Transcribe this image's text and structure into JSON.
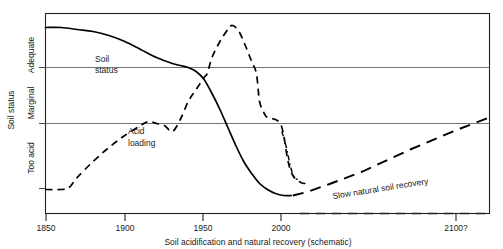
{
  "chart_data": {
    "type": "line",
    "title": "",
    "xlabel": "Soil acidification and natural recovery (schematic)",
    "ylabel": "Soil status",
    "grid": true,
    "legend_position": "inline-annotations",
    "xlim": [
      1850,
      2130
    ],
    "ylim": [
      0,
      100
    ],
    "xticks": [
      1850,
      1900,
      1950,
      2000,
      2100
    ],
    "xtick_labels": [
      "1850",
      "1900",
      "1950",
      "2000",
      "2100?"
    ],
    "ytick_categories": [
      "Too acid",
      "Marginal",
      "Adequate"
    ],
    "ygridlines": [
      40,
      70
    ],
    "annotations": [
      {
        "id": "soil-status",
        "text": "Soil status",
        "line1": "Soil",
        "line2": "status",
        "x": 1880,
        "y": 80
      },
      {
        "id": "acid-loading",
        "text": "Acid loading",
        "line1": "Acid",
        "line2": "loading",
        "x": 1905,
        "y": 35
      },
      {
        "id": "slow-recovery",
        "text": "Slow natural soil recovery",
        "x": 2030,
        "y": 14,
        "rotation": -8
      }
    ],
    "series": [
      {
        "name": "Soil status",
        "style": "solid",
        "color": "#000000",
        "points": [
          [
            1850,
            93
          ],
          [
            1860,
            93
          ],
          [
            1870,
            92
          ],
          [
            1880,
            91
          ],
          [
            1890,
            89
          ],
          [
            1900,
            86
          ],
          [
            1910,
            82
          ],
          [
            1920,
            78
          ],
          [
            1930,
            75
          ],
          [
            1935,
            74
          ],
          [
            1940,
            73
          ],
          [
            1945,
            71
          ],
          [
            1950,
            67
          ],
          [
            1955,
            60
          ],
          [
            1960,
            52
          ],
          [
            1965,
            43
          ],
          [
            1970,
            34
          ],
          [
            1975,
            26
          ],
          [
            1980,
            20
          ],
          [
            1985,
            15
          ],
          [
            1990,
            12
          ],
          [
            1995,
            10
          ],
          [
            2000,
            9
          ],
          [
            2005,
            9
          ]
        ]
      },
      {
        "name": "Acid loading",
        "style": "dashed",
        "color": "#000000",
        "points": [
          [
            1850,
            12
          ],
          [
            1860,
            12
          ],
          [
            1865,
            13
          ],
          [
            1870,
            18
          ],
          [
            1880,
            26
          ],
          [
            1890,
            33
          ],
          [
            1900,
            39
          ],
          [
            1910,
            44
          ],
          [
            1915,
            46
          ],
          [
            1920,
            45
          ],
          [
            1925,
            44
          ],
          [
            1930,
            41
          ],
          [
            1935,
            47
          ],
          [
            1940,
            56
          ],
          [
            1945,
            62
          ],
          [
            1950,
            68
          ],
          [
            1952,
            70
          ],
          [
            1955,
            78
          ],
          [
            1960,
            86
          ],
          [
            1965,
            92
          ],
          [
            1968,
            94
          ],
          [
            1972,
            91
          ],
          [
            1976,
            84
          ],
          [
            1980,
            76
          ],
          [
            1983,
            70
          ],
          [
            1985,
            56
          ],
          [
            1988,
            50
          ],
          [
            1990,
            48
          ],
          [
            1995,
            47
          ],
          [
            1998,
            45
          ],
          [
            2000,
            40
          ],
          [
            2003,
            26
          ],
          [
            2006,
            19
          ],
          [
            2010,
            16
          ],
          [
            2013,
            15
          ],
          [
            2016,
            16
          ]
        ]
      },
      {
        "name": "Alternative acid loading decline",
        "style": "dash-dot",
        "color": "#000000",
        "points": [
          [
            1999,
            41
          ],
          [
            2001,
            36
          ],
          [
            2003,
            29
          ],
          [
            2005,
            22
          ],
          [
            2007,
            18
          ],
          [
            2009,
            17
          ]
        ]
      },
      {
        "name": "Slow natural soil recovery",
        "style": "long-dashed",
        "color": "#000000",
        "points": [
          [
            2006,
            9
          ],
          [
            2016,
            11
          ],
          [
            2030,
            15
          ],
          [
            2050,
            21
          ],
          [
            2080,
            32
          ],
          [
            2110,
            42
          ],
          [
            2130,
            48
          ]
        ]
      }
    ]
  },
  "axis": {
    "x_caption": "Soil acidification and natural recovery (schematic)",
    "y_caption": "Soil status",
    "y_categories": [
      "Adequate",
      "Marginal",
      "Too acid"
    ],
    "x_tick_labels": [
      "1850",
      "1900",
      "1950",
      "2000",
      "2100?"
    ]
  },
  "labels": {
    "soil_status_line1": "Soil",
    "soil_status_line2": "status",
    "acid_loading_line1": "Acid",
    "acid_loading_line2": "loading",
    "slow_recovery": "Slow natural soil recovery"
  },
  "colors": {
    "ink": "#000000",
    "grid": "#666666",
    "frame": "#222222",
    "background": "#ffffff"
  }
}
